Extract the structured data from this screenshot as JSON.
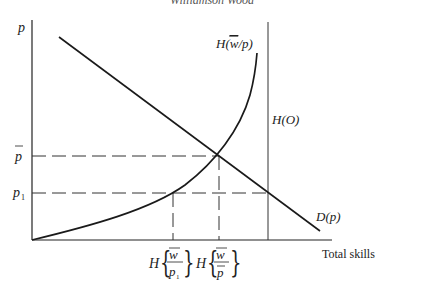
{
  "header": {
    "text": "Williamson Wood"
  },
  "axes": {
    "y_label": "p",
    "x_label": "Total skills"
  },
  "y_ticks": [
    {
      "id": "pbar",
      "base": "p",
      "bar": true,
      "sub": ""
    },
    {
      "id": "p1",
      "base": "p",
      "bar": false,
      "sub": "1"
    }
  ],
  "x_ticks": [
    {
      "id": "h_w_p1",
      "func": "H",
      "num": "w",
      "den": "p",
      "den_sub": "1"
    },
    {
      "id": "h_w_pbar",
      "func": "H",
      "num": "w",
      "den": "p",
      "den_sub": ""
    }
  ],
  "curves": [
    {
      "id": "supply_curve",
      "label_func": "H(",
      "label_mid": "w",
      "label_tail": "/p)"
    },
    {
      "id": "demand_line",
      "label": "D(p)"
    },
    {
      "id": "limit_line",
      "label": "H(O)"
    }
  ],
  "colors": {
    "line": "#1a1a1a",
    "dash": "#333333",
    "axis": "#222222"
  }
}
